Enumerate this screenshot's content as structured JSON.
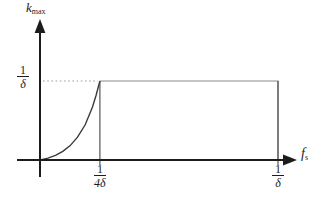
{
  "figure": {
    "y_axis_label": {
      "base": "k",
      "sub": "max"
    },
    "x_axis_label": {
      "base": "f",
      "sub": "s"
    },
    "y_tick_label": {
      "num": "1",
      "den": "δ"
    },
    "x_tick_labels": [
      {
        "num": "1",
        "den": "4δ"
      },
      {
        "num": "1",
        "den": "δ"
      }
    ],
    "colors": {
      "background": "#ffffff",
      "axis": "#1c1c1c",
      "curve": "#3a3a3a",
      "plateau": "#8c8c8c",
      "guide": "#555555",
      "dotted": "#9e9e9e",
      "text": "#1c1c1c"
    }
  },
  "chart_data": {
    "type": "line",
    "title": "",
    "xlabel": "f_s",
    "ylabel": "k_max",
    "x_unit": "multiples of 1/δ",
    "xlim": [
      0,
      1.12
    ],
    "ylim": [
      0,
      1.3
    ],
    "grid": false,
    "legend": false,
    "x_ticks": [
      {
        "x": 0.25,
        "label": "1/(4δ)"
      },
      {
        "x": 1.0,
        "label": "1/δ"
      }
    ],
    "y_ticks": [
      {
        "y": 1.0,
        "label": "1/δ"
      }
    ],
    "curve_end_x": 0.25,
    "series": [
      {
        "name": "k_max vs f_s",
        "description": "exponential-like rise from origin up to 1/δ at f_s = 1/(4δ), constant plateau at 1/δ until f_s = 1/δ, then vertical drop to 0",
        "x": [
          0,
          0.031,
          0.063,
          0.094,
          0.125,
          0.156,
          0.188,
          0.219,
          0.234,
          0.25,
          1.0,
          1.0
        ],
        "y": [
          0,
          0.024,
          0.059,
          0.109,
          0.182,
          0.289,
          0.445,
          0.671,
          0.82,
          1.0,
          1.0,
          0.0
        ]
      }
    ],
    "annotations": [
      "dotted horizontal guide from y-axis at height 1/δ to the curve peak",
      "vertical guide line at f_s = 1/(4δ)",
      "vertical drop line at f_s = 1/δ"
    ]
  }
}
